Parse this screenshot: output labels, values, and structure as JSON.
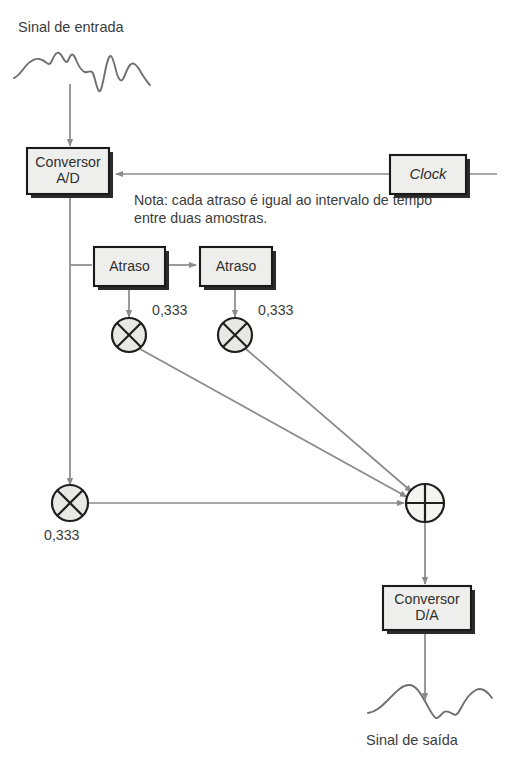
{
  "diagram": {
    "title_input": "Sinal de entrada",
    "title_output": "Sinal de saída",
    "note": "Nota: cada atraso é igual ao intervalo de tempo entre duas amostras.",
    "blocks": [
      {
        "id": "adc",
        "label": "Conversor\nA/D",
        "line1": "Conversor",
        "line2": "A/D"
      },
      {
        "id": "clock",
        "label": "Clock"
      },
      {
        "id": "delay1",
        "label": "Atraso"
      },
      {
        "id": "delay2",
        "label": "Atraso"
      },
      {
        "id": "dac",
        "label": "Conversor\nD/A",
        "line1": "Conversor",
        "line2": "D/A"
      }
    ],
    "gains": [
      {
        "id": "gain1",
        "value": "0,333"
      },
      {
        "id": "gain2",
        "value": "0,333"
      },
      {
        "id": "gain3",
        "value": "0,333"
      }
    ],
    "operators": [
      {
        "id": "mult1",
        "symbol": "multiply"
      },
      {
        "id": "mult2",
        "symbol": "multiply"
      },
      {
        "id": "mult3",
        "symbol": "multiply"
      },
      {
        "id": "sum",
        "symbol": "plus"
      }
    ],
    "colors": {
      "box_fill": "#eeeeec",
      "box_stroke": "#1a1a1a",
      "box_shadow": "#2b2b2b",
      "line": "#8a8a8a",
      "waveform": "#6e6e6e",
      "text": "#3c3c3c",
      "background": "#ffffff"
    }
  }
}
